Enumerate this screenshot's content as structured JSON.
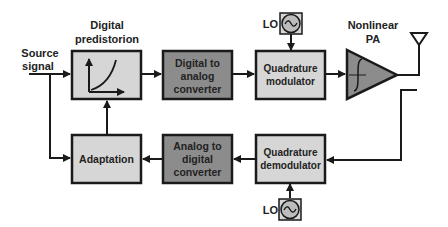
{
  "colors": {
    "light_block": "#d6d6d6",
    "dark_block": "#8c8c8c",
    "pa_fill": "#8c8c8c",
    "stroke": "#1a1a1a",
    "text": "#222222"
  },
  "labels": {
    "source_line1": "Source",
    "source_line2": "signal",
    "dpd_title_line1": "Digital",
    "dpd_title_line2": "predistorion",
    "dac_line1": "Digital to",
    "dac_line2": "analog",
    "dac_line3": "converter",
    "qmod_line1": "Quadrature",
    "qmod_line2": "modulator",
    "lo_top": "LO",
    "pa_line1": "Nonlinear",
    "pa_line2": "PA",
    "adapt": "Adaptation",
    "adc_line1": "Analog to",
    "adc_line2": "digital",
    "adc_line3": "converter",
    "qdemod_line1": "Quadrature",
    "qdemod_line2": "demodulator",
    "lo_bottom": "LO"
  }
}
